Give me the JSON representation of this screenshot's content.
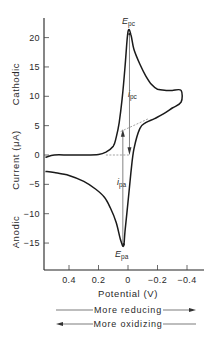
{
  "chart_data": {
    "type": "line",
    "title": "",
    "xlabel": "Potential (V)",
    "ylabel": "Current (μA)",
    "ylabel_upper": "Cathodic",
    "ylabel_lower": "Anodic",
    "x_ticks": [
      "0.4",
      "0.2",
      "0",
      "−0.2",
      "−0.4"
    ],
    "x_tick_values": [
      0.4,
      0.2,
      0,
      -0.2,
      -0.4
    ],
    "y_ticks": [
      "20",
      "15",
      "10",
      "5",
      "0",
      "−5",
      "−10",
      "−15"
    ],
    "y_tick_values": [
      20,
      15,
      10,
      5,
      0,
      -5,
      -10,
      -15
    ],
    "xlim": [
      0.57,
      -0.48
    ],
    "ylim": [
      -19,
      24
    ],
    "x_inverted": true,
    "grid": false,
    "series": [
      {
        "name": "Cyclic voltammogram",
        "x": [
          0.56,
          0.5,
          0.4,
          0.3,
          0.2,
          0.15,
          0.1,
          0.08,
          0.06,
          0.04,
          0.02,
          0.0,
          -0.02,
          -0.04,
          -0.08,
          -0.12,
          -0.16,
          -0.2,
          -0.26,
          -0.3,
          -0.36,
          -0.36,
          -0.3,
          -0.24,
          -0.18,
          -0.12,
          -0.08,
          -0.04,
          -0.02,
          0.0,
          0.02,
          0.03,
          0.05,
          0.08,
          0.12,
          0.16,
          0.22,
          0.3,
          0.4,
          0.5,
          0.56
        ],
        "y": [
          -0.4,
          0.0,
          0.0,
          0.0,
          0.1,
          0.5,
          1.5,
          3.0,
          5.5,
          9.5,
          15.0,
          21.0,
          20.5,
          18.0,
          15.5,
          13.5,
          12.0,
          11.2,
          11.0,
          11.0,
          11.0,
          9.0,
          8.0,
          7.0,
          6.2,
          5.5,
          4.5,
          1.0,
          -3.0,
          -8.0,
          -13.0,
          -15.5,
          -14.5,
          -11.5,
          -9.0,
          -7.2,
          -5.8,
          -4.5,
          -3.5,
          -3.0,
          -2.8
        ]
      }
    ],
    "annotations": [
      {
        "label": "E_pc",
        "x": -0.01,
        "y": 21.5
      },
      {
        "label": "i_pc",
        "x": -0.01,
        "y": 11,
        "description": "downward arrow from peak to baseline"
      },
      {
        "label": "E_pa",
        "x": 0.03,
        "y": -16.8
      },
      {
        "label": "i_pa",
        "x": 0.04,
        "y": -5.5,
        "description": "upward arrow from anodic peak to extrapolated baseline"
      }
    ],
    "direction_notes": [
      {
        "label": "More reducing",
        "direction": "right"
      },
      {
        "label": "More oxidizing",
        "direction": "left"
      }
    ]
  },
  "labels": {
    "epc_main": "E",
    "epc_sub": "pc",
    "ipc_main": "i",
    "ipc_sub": "pc",
    "epa_main": "E",
    "epa_sub": "pa",
    "ipa_main": "i",
    "ipa_sub": "pa"
  }
}
